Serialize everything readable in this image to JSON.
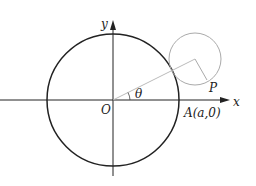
{
  "diagram": {
    "labels": {
      "y_axis": "y",
      "x_axis": "x",
      "origin": "O",
      "angle": "θ",
      "point_p": "P",
      "point_a": "A(a,0)"
    },
    "colors": {
      "main_circle": "#222222",
      "small_circle": "#aaaaaa",
      "axes": "#222222"
    }
  }
}
